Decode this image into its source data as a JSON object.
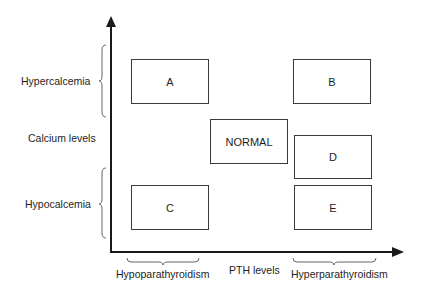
{
  "diagram": {
    "y_axis": {
      "label": "Calcium levels",
      "groups": [
        {
          "label": "Hypercalcemia"
        },
        {
          "label": "Hypocalcemia"
        }
      ]
    },
    "x_axis": {
      "label": "PTH levels",
      "groups": [
        {
          "label": "Hypoparathyroidism"
        },
        {
          "label": "Hyperparathyroidism"
        }
      ]
    },
    "boxes": [
      {
        "id": "A",
        "label": "A"
      },
      {
        "id": "B",
        "label": "B"
      },
      {
        "id": "NORMAL",
        "label": "NORMAL"
      },
      {
        "id": "D",
        "label": "D"
      },
      {
        "id": "C",
        "label": "C"
      },
      {
        "id": "E",
        "label": "E"
      }
    ],
    "colors": {
      "line": "#1a1a1a",
      "box_border": "#3a3a3a",
      "background": "#ffffff"
    }
  }
}
